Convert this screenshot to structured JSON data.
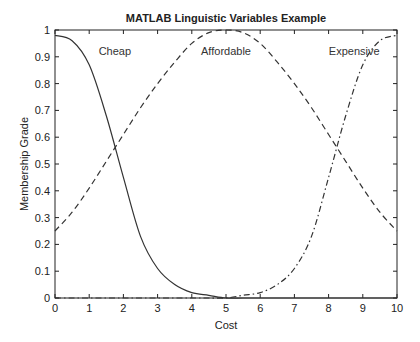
{
  "chart_data": {
    "type": "line",
    "title": "MATLAB Linguistic Variables Example",
    "xlabel": "Cost",
    "ylabel": "Membership Grade",
    "xlim": [
      0,
      10
    ],
    "ylim": [
      0,
      1
    ],
    "xticks": [
      0,
      1,
      2,
      3,
      4,
      5,
      6,
      7,
      8,
      9,
      10
    ],
    "yticks": [
      0,
      0.1,
      0.2,
      0.3,
      0.4,
      0.5,
      0.6,
      0.7,
      0.8,
      0.9,
      1
    ],
    "xtick_labels": [
      "0",
      "1",
      "2",
      "3",
      "4",
      "5",
      "6",
      "7",
      "8",
      "9",
      "10"
    ],
    "ytick_labels": [
      "0",
      "0.1",
      "0.2",
      "0.3",
      "0.4",
      "0.5",
      "0.6",
      "0.7",
      "0.8",
      "0.9",
      "1"
    ],
    "grid": false,
    "x": [
      0,
      0.5,
      1,
      1.5,
      2,
      2.5,
      3,
      3.5,
      4,
      4.5,
      5,
      5.5,
      6,
      6.5,
      7,
      7.5,
      8,
      8.5,
      9,
      9.5,
      10
    ],
    "series": [
      {
        "name": "Cheap",
        "style": "solid",
        "label_pos": [
          1.75,
          0.92
        ],
        "values": [
          0.98,
          0.96,
          0.87,
          0.68,
          0.45,
          0.23,
          0.11,
          0.05,
          0.02,
          0.01,
          0.0,
          0.0,
          0.0,
          0.0,
          0.0,
          0.0,
          0.0,
          0.0,
          0.0,
          0.0,
          0.0
        ]
      },
      {
        "name": "Affordable",
        "style": "dashed",
        "label_pos": [
          5,
          0.92
        ],
        "values": [
          0.25,
          0.32,
          0.41,
          0.51,
          0.61,
          0.71,
          0.8,
          0.88,
          0.95,
          0.99,
          1.0,
          0.99,
          0.95,
          0.88,
          0.8,
          0.71,
          0.61,
          0.51,
          0.41,
          0.32,
          0.25
        ]
      },
      {
        "name": "Expensive",
        "style": "dashdot",
        "label_pos": [
          8.75,
          0.92
        ],
        "values": [
          0.0,
          0.0,
          0.0,
          0.0,
          0.0,
          0.0,
          0.0,
          0.0,
          0.0,
          0.0,
          0.0,
          0.01,
          0.02,
          0.05,
          0.11,
          0.23,
          0.45,
          0.68,
          0.87,
          0.96,
          0.98
        ]
      }
    ]
  }
}
